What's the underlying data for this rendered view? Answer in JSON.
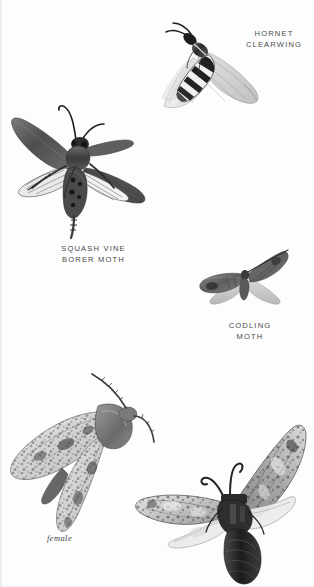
{
  "plate": {
    "title": "Clearwing and borer moths illustration plate",
    "background_color": "#fdfdfd",
    "ink_color": "#4a4a4a",
    "medium": "engraved halftone ink illustration"
  },
  "labels": {
    "hornet_clearwing": "HORNET\nCLEARWING",
    "squash_vine_borer": "SQUASH VINE\nBORER MOTH",
    "codling_moth": "CODLING\nMOTH",
    "female": "female"
  },
  "specimens": [
    {
      "id": "hornet-clearwing",
      "name": "Hornet Clearwing",
      "label": "HORNET\nCLEARWING",
      "description": "wasp-mimic moth with banded black and white abdomen and transparent veined wings",
      "pose": "wings swept back, head upper-left"
    },
    {
      "id": "squash-vine-borer-moth",
      "name": "Squash Vine Borer Moth",
      "label": "SQUASH VINE\nBORER MOTH",
      "description": "dark bodied moth with spread forewings, clear hindwing panels and fringed hind legs",
      "pose": "wings fully spread, head upper-right"
    },
    {
      "id": "codling-moth",
      "name": "Codling Moth",
      "label": "CODLING\nMOTH",
      "description": "small mottled grey-brown moth with pale hindwings",
      "pose": "wings spread, small scale"
    },
    {
      "id": "leopard-moth-female",
      "name": "Leopard Moth female",
      "label": "female",
      "description": "large speckled moth with white wings marked by dark blotches and long antenna",
      "pose": "wings folded back, head upper-right"
    },
    {
      "id": "leopard-moth-male",
      "name": "Leopard Moth male",
      "label": "",
      "description": "large moth with dark segmented abdomen, curled antennae and mottled spread wings",
      "pose": "wings spread, head centre"
    }
  ]
}
